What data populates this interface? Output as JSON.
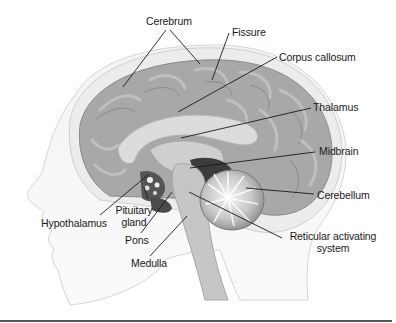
{
  "diagram": {
    "colors": {
      "background": "#ffffff",
      "cortex": "#a9a9a9",
      "cortex_dark": "#8c8c8c",
      "skull": "#e4e4e4",
      "callosum": "#d8d8d8",
      "brainstem": "#c9c9c9",
      "dark_region": "#3a3a3a",
      "label_text": "#1a1a1a",
      "leader_line": "#1a1a1a"
    },
    "labels": [
      {
        "id": "cerebrum",
        "text": "Cerebrum"
      },
      {
        "id": "fissure",
        "text": "Fissure"
      },
      {
        "id": "corpus-callosum",
        "text": "Corpus callosum"
      },
      {
        "id": "thalamus",
        "text": "Thalamus"
      },
      {
        "id": "midbrain",
        "text": "Midbrain"
      },
      {
        "id": "cerebellum",
        "text": "Cerebellum"
      },
      {
        "id": "hypothalamus",
        "text": "Hypothalamus"
      },
      {
        "id": "pituitary-gland",
        "text": "Pituitary",
        "text2": "gland"
      },
      {
        "id": "pons",
        "text": "Pons"
      },
      {
        "id": "reticular-activating-system",
        "text": "Reticular activating",
        "text2": "system"
      },
      {
        "id": "medulla",
        "text": "Medulla"
      }
    ]
  }
}
